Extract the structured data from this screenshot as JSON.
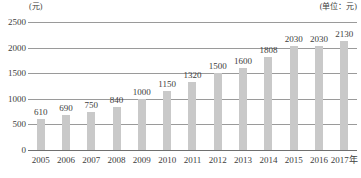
{
  "unit_left": "(元)",
  "unit_right": "(单位：元)",
  "axis_suffix": "年",
  "colors": {
    "bar": "#c9c9c9",
    "gridline": "#9a9a9a",
    "baseline": "#6f6f6f",
    "text": "#3d3d3d",
    "background": "#ffffff"
  },
  "chart_data": {
    "type": "bar",
    "title": "",
    "subtitle": "",
    "xlabel": "年",
    "ylabel": "元",
    "categories": [
      "2005",
      "2006",
      "2007",
      "2008",
      "2009",
      "2010",
      "2011",
      "2012",
      "2013",
      "2014",
      "2015",
      "2016",
      "2017年"
    ],
    "values": [
      610,
      690,
      750,
      840,
      1000,
      1150,
      1320,
      1500,
      1600,
      1808,
      2030,
      2030,
      2130
    ],
    "data_labels": [
      "610",
      "690",
      "750",
      "840",
      "1000",
      "1150",
      "1320",
      "1500",
      "1600",
      "1808",
      "2030",
      "2030",
      "2130"
    ],
    "ylim": [
      0,
      2500
    ],
    "yticks": [
      0,
      500,
      1000,
      1500,
      2000,
      2500
    ],
    "ytick_labels": [
      "0",
      "500",
      "1000",
      "1500",
      "2000",
      "2500"
    ],
    "grid": true,
    "legend": "none",
    "unit_note_left": "(元)",
    "unit_note_right": "(单位：元)"
  }
}
